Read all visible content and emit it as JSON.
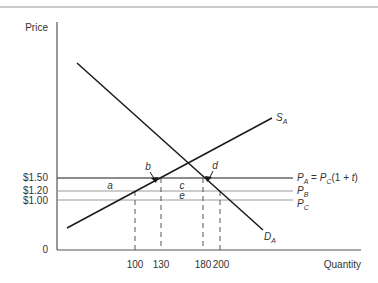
{
  "diagram": {
    "axes": {
      "y_label": "Price",
      "x_label": "Quantity",
      "origin_label": "0"
    },
    "price_ticks": [
      {
        "label": "$1.50",
        "value": 1.5
      },
      {
        "label": "$1.20",
        "value": 1.2
      },
      {
        "label": "$1.00",
        "value": 1.0
      }
    ],
    "quantity_ticks": [
      {
        "label": "100",
        "value": 100
      },
      {
        "label": "130",
        "value": 130
      },
      {
        "label": "180",
        "value": 180
      },
      {
        "label": "200",
        "value": 200
      }
    ],
    "curves": {
      "supply": {
        "name": "S",
        "sub": "A"
      },
      "demand": {
        "name": "D",
        "sub": "A"
      }
    },
    "price_lines": {
      "pa": {
        "p": "P",
        "sub": "A",
        "eq": " = ",
        "p2": "P",
        "sub2": "C",
        "rest": "(1 + ",
        "t": "t",
        "close": ")"
      },
      "pb": {
        "p": "P",
        "sub": "B"
      },
      "pc": {
        "p": "P",
        "sub": "C"
      }
    },
    "areas": {
      "a": "a",
      "b": "b",
      "c": "c",
      "d": "d",
      "e": "e"
    },
    "colors": {
      "axis": "#555555",
      "curve": "#1a1a1a",
      "price_line_main": "#666666",
      "price_line_light": "#9a9a9a",
      "dash": "#555555"
    }
  }
}
